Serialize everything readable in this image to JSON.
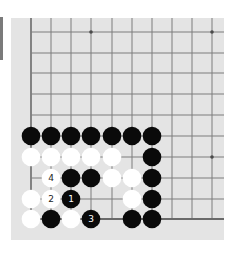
{
  "board": {
    "background_color": "#e4e4e4",
    "line_color": "#7d7d7d",
    "edge_line_color": "#6a6a6a",
    "black_stone_color": "#0a0a0a",
    "white_stone_color": "#ffffff",
    "columns": 10,
    "rows": 10,
    "col_x": [
      20,
      40,
      60,
      80,
      101,
      121,
      141,
      161,
      181,
      201
    ],
    "row_y": [
      14,
      35,
      55,
      76,
      97,
      118,
      139,
      160,
      181,
      201
    ],
    "edges": {
      "left": true,
      "bottom": true,
      "top": false,
      "right": false
    },
    "star_points": [
      {
        "col": 3,
        "row": 0
      },
      {
        "col": 9,
        "row": 0
      },
      {
        "col": 9,
        "row": 6
      }
    ],
    "stones": [
      {
        "color": "black",
        "col": 0,
        "row": 5
      },
      {
        "color": "black",
        "col": 1,
        "row": 5
      },
      {
        "color": "black",
        "col": 2,
        "row": 5
      },
      {
        "color": "black",
        "col": 3,
        "row": 5
      },
      {
        "color": "black",
        "col": 4,
        "row": 5
      },
      {
        "color": "black",
        "col": 5,
        "row": 5
      },
      {
        "color": "black",
        "col": 6,
        "row": 5
      },
      {
        "color": "white",
        "col": 0,
        "row": 6
      },
      {
        "color": "white",
        "col": 1,
        "row": 6
      },
      {
        "color": "white",
        "col": 2,
        "row": 6
      },
      {
        "color": "white",
        "col": 3,
        "row": 6
      },
      {
        "color": "white",
        "col": 4,
        "row": 6
      },
      {
        "color": "black",
        "col": 6,
        "row": 6
      },
      {
        "color": "white",
        "col": 1,
        "row": 7,
        "label": "4"
      },
      {
        "color": "black",
        "col": 2,
        "row": 7
      },
      {
        "color": "black",
        "col": 3,
        "row": 7
      },
      {
        "color": "white",
        "col": 4,
        "row": 7
      },
      {
        "color": "white",
        "col": 5,
        "row": 7
      },
      {
        "color": "black",
        "col": 6,
        "row": 7
      },
      {
        "color": "white",
        "col": 0,
        "row": 8
      },
      {
        "color": "white",
        "col": 1,
        "row": 8,
        "label": "2"
      },
      {
        "color": "black",
        "col": 2,
        "row": 8,
        "label": "1"
      },
      {
        "color": "white",
        "col": 5,
        "row": 8
      },
      {
        "color": "black",
        "col": 6,
        "row": 8
      },
      {
        "color": "white",
        "col": 0,
        "row": 9
      },
      {
        "color": "black",
        "col": 1,
        "row": 9
      },
      {
        "color": "white",
        "col": 2,
        "row": 9
      },
      {
        "color": "black",
        "col": 3,
        "row": 9,
        "label": "3"
      },
      {
        "color": "black",
        "col": 5,
        "row": 9
      },
      {
        "color": "black",
        "col": 6,
        "row": 9
      }
    ],
    "move_labels": [
      {
        "move": "1",
        "color": "black"
      },
      {
        "move": "2",
        "color": "white"
      },
      {
        "move": "3",
        "color": "black"
      },
      {
        "move": "4",
        "color": "white"
      }
    ]
  }
}
